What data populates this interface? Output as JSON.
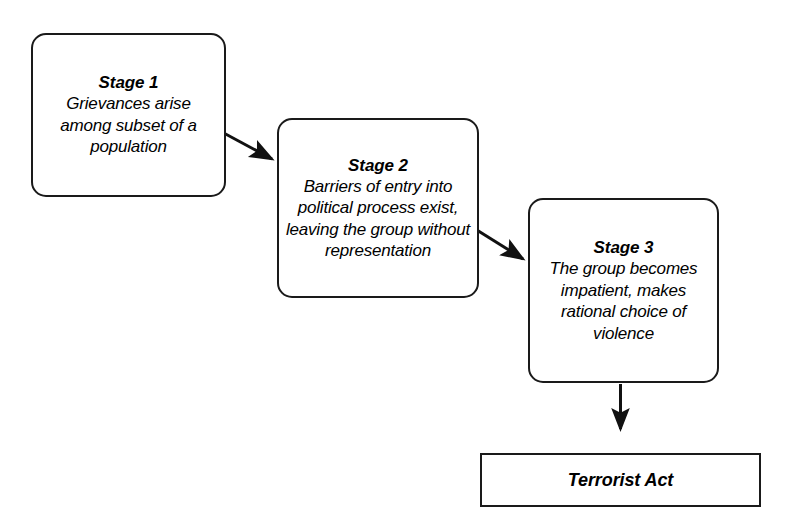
{
  "diagram": {
    "type": "flowchart",
    "background_color": "#ffffff",
    "stroke_color": "#1a1a1a",
    "text_color": "#000000",
    "nodes": [
      {
        "id": "stage-1",
        "shape": "rounded-rectangle",
        "title": "Stage 1",
        "body": "Grievances arise among subset of a population"
      },
      {
        "id": "stage-2",
        "shape": "rounded-rectangle",
        "title": "Stage 2",
        "body": "Barriers of entry into political process exist, leaving the group without representation"
      },
      {
        "id": "stage-3",
        "shape": "rounded-rectangle",
        "title": "Stage 3",
        "body": "The group becomes impatient, makes rational choice of violence"
      },
      {
        "id": "terrorist-act",
        "shape": "rectangle",
        "title": "Terrorist Act",
        "body": ""
      }
    ],
    "connectors": [
      {
        "id": "arrow-stage1-to-stage2",
        "from": "stage-1",
        "to": "stage-2",
        "direction": "diagonal-down-right",
        "arrowhead": "filled-triangle"
      },
      {
        "id": "arrow-stage2-to-stage3",
        "from": "stage-2",
        "to": "stage-3",
        "direction": "diagonal-down-right",
        "arrowhead": "filled-triangle"
      },
      {
        "id": "arrow-stage3-to-terrorist-act",
        "from": "stage-3",
        "to": "terrorist-act",
        "direction": "vertical-down",
        "arrowhead": "filled-triangle"
      }
    ]
  }
}
